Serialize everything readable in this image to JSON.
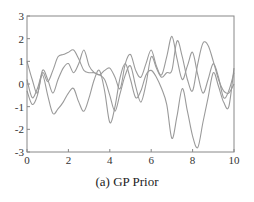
{
  "chart_data": {
    "type": "line",
    "title": "",
    "caption": "(a) GP Prior",
    "xlabel": "",
    "ylabel": "",
    "xlim": [
      0,
      10
    ],
    "ylim": [
      -3,
      3
    ],
    "xticks": [
      0,
      2,
      4,
      6,
      8,
      10
    ],
    "yticks": [
      -3,
      -2,
      -1,
      0,
      1,
      2,
      3
    ],
    "grid": false,
    "legend": null,
    "line_color": "#9a9a9a",
    "x": [
      0,
      0.25,
      0.5,
      0.75,
      1,
      1.25,
      1.5,
      1.75,
      2,
      2.25,
      2.5,
      2.75,
      3,
      3.25,
      3.5,
      3.75,
      4,
      4.25,
      4.5,
      4.75,
      5,
      5.25,
      5.5,
      5.75,
      6,
      6.25,
      6.5,
      6.75,
      7,
      7.25,
      7.5,
      7.75,
      8,
      8.25,
      8.5,
      8.75,
      9,
      9.25,
      9.5,
      9.75,
      10
    ],
    "series": [
      {
        "name": "sample 1",
        "values": [
          1.0,
          0.2,
          -0.4,
          0.5,
          0.1,
          0.6,
          1.2,
          1.3,
          1.4,
          1.5,
          1.1,
          0.6,
          0.5,
          0.5,
          0.4,
          0.6,
          0.7,
          0.3,
          -0.2,
          0.9,
          1.3,
          0.6,
          0.3,
          0.9,
          1.5,
          0.8,
          0.4,
          1.2,
          2.1,
          1.1,
          0.2,
          0.8,
          1.4,
          0.4,
          -0.4,
          0.2,
          0.9,
          0.3,
          -0.6,
          -0.3,
          0.5
        ]
      },
      {
        "name": "sample 2",
        "values": [
          -0.3,
          -0.9,
          -0.5,
          0.6,
          0.2,
          -0.4,
          0.2,
          0.7,
          0.9,
          0.5,
          0.9,
          1.5,
          0.8,
          0.5,
          0.4,
          0.2,
          -0.5,
          -1.2,
          -0.4,
          0.4,
          0.8,
          -0.1,
          -0.8,
          0.0,
          1.2,
          0.7,
          0.3,
          0.5,
          0.6,
          1.9,
          1.2,
          0.2,
          -0.3,
          0.9,
          1.8,
          1.7,
          1.0,
          0.2,
          -0.3,
          -0.4,
          0.0
        ]
      },
      {
        "name": "sample 3",
        "values": [
          0.2,
          -0.6,
          -0.2,
          0.4,
          -0.5,
          -1.3,
          -1.1,
          -0.8,
          -0.4,
          -0.2,
          -0.8,
          -1.2,
          -0.6,
          0.2,
          0.6,
          -0.3,
          -1.7,
          -1.0,
          0.3,
          0.9,
          0.2,
          -0.6,
          -0.3,
          0.4,
          0.6,
          0.3,
          -0.2,
          -0.9,
          -2.4,
          -1.4,
          -0.2,
          -1.2,
          -2.3,
          -2.8,
          -1.7,
          -0.6,
          0.5,
          -0.1,
          -0.8,
          -1.0,
          0.7
        ]
      }
    ]
  }
}
